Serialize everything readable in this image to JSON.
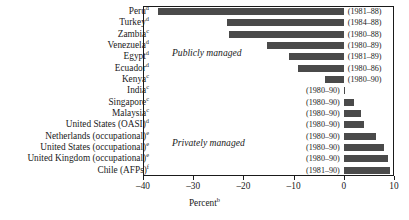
{
  "chart_data": {
    "type": "bar",
    "orientation": "horizontal",
    "title": "",
    "xlabel": "Percent",
    "xlabel_superscript": "b",
    "ylabel": "",
    "xlim": [
      -40,
      10
    ],
    "xticks": [
      -40,
      -30,
      -20,
      -10,
      0,
      10
    ],
    "xticklabels": [
      "–40",
      "–30",
      "–20",
      "–10",
      "0",
      "10"
    ],
    "grid": false,
    "legend": false,
    "bar_color": "#4a4a4a",
    "annotations": [
      {
        "text": "Publicly managed",
        "style": "italic"
      },
      {
        "text": "Privately managed",
        "style": "italic"
      }
    ],
    "categories": [
      "Peru",
      "Turkey",
      "Zambia",
      "Venezuela",
      "Egypt",
      "Ecuador",
      "Kenya",
      "India",
      "Singapore",
      "Malaysia",
      "United States (OASI)",
      "Netherlands (occupational)",
      "United States (occupational)",
      "United Kingdom (occupational)",
      "Chile (AFPs)"
    ],
    "values": [
      -37.0,
      -23.3,
      -22.8,
      -15.3,
      -11.0,
      -9.2,
      -3.7,
      0.3,
      2.0,
      3.5,
      4.0,
      6.5,
      8.0,
      8.8,
      9.2
    ],
    "period_labels": [
      "(1981–88)",
      "(1984–88)",
      "(1980–88)",
      "(1980–89)",
      "(1981–89)",
      "(1980–86)",
      "(1980–90)",
      "(1980–90)",
      "(1980–90)",
      "(1980–90)",
      "(1980–90)",
      "(1980–90)",
      "(1980–90)",
      "(1980–90)",
      "(1981–90)"
    ],
    "footnote_marks": [
      "d",
      "d",
      "c",
      "d",
      "d",
      "d",
      "c",
      "c",
      "c",
      "c",
      "d",
      "e",
      "e",
      "e",
      "f"
    ]
  },
  "rows": [
    {
      "label": "Peru",
      "mark": "d",
      "value": -37.0,
      "period": "(1981–88)"
    },
    {
      "label": "Turkey",
      "mark": "d",
      "value": -23.3,
      "period": "(1984–88)"
    },
    {
      "label": "Zambia",
      "mark": "c",
      "value": -22.8,
      "period": "(1980–88)"
    },
    {
      "label": "Venezuela",
      "mark": "d",
      "value": -15.3,
      "period": "(1980–89)"
    },
    {
      "label": "Egypt",
      "mark": "d",
      "value": -11.0,
      "period": "(1981–89)"
    },
    {
      "label": "Ecuador",
      "mark": "d",
      "value": -9.2,
      "period": "(1980–86)"
    },
    {
      "label": "Kenya",
      "mark": "c",
      "value": -3.7,
      "period": "(1980–90)"
    },
    {
      "label": "India",
      "mark": "c",
      "value": 0.3,
      "period": "(1980–90)"
    },
    {
      "label": "Singapore",
      "mark": "c",
      "value": 2.0,
      "period": "(1980–90)"
    },
    {
      "label": "Malaysia",
      "mark": "c",
      "value": 3.5,
      "period": "(1980–90)"
    },
    {
      "label": "United States (OASI)",
      "mark": "d",
      "value": 4.0,
      "period": "(1980–90)"
    },
    {
      "label": "Netherlands (occupational)",
      "mark": "e",
      "value": 6.5,
      "period": "(1980–90)"
    },
    {
      "label": "United States (occupational)",
      "mark": "e",
      "value": 8.0,
      "period": "(1980–90)"
    },
    {
      "label": "United Kingdom (occupational)",
      "mark": "e",
      "value": 8.8,
      "period": "(1980–90)"
    },
    {
      "label": "Chile (AFPs)",
      "mark": "f",
      "value": 9.2,
      "period": "(1981–90)"
    }
  ],
  "groups": {
    "public": "Publicly managed",
    "private": "Privately managed"
  },
  "axis": {
    "title": "Percent",
    "title_superscript": "b",
    "ticklabels": [
      "–40",
      "–30",
      "–20",
      "–10",
      "0",
      "10"
    ]
  }
}
